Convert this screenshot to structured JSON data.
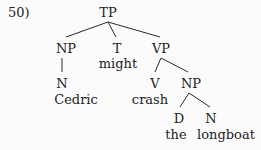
{
  "example_number": "50)",
  "tree": {
    "root": "TP",
    "nodes": [
      {
        "id": "tp",
        "label": "TP",
        "x": 108,
        "y": 6
      },
      {
        "id": "np_subj",
        "label": "NP",
        "x": 66,
        "y": 42
      },
      {
        "id": "t",
        "label": "T",
        "x": 117,
        "y": 42
      },
      {
        "id": "t_word",
        "label": "might",
        "x": 118,
        "y": 57
      },
      {
        "id": "vp",
        "label": "VP",
        "x": 161,
        "y": 42
      },
      {
        "id": "n_subj",
        "label": "N",
        "x": 62,
        "y": 77
      },
      {
        "id": "n_subj_word",
        "label": "Cedric",
        "x": 76,
        "y": 93
      },
      {
        "id": "v",
        "label": "V",
        "x": 155,
        "y": 77
      },
      {
        "id": "v_word",
        "label": "crash",
        "x": 150,
        "y": 93
      },
      {
        "id": "np_obj",
        "label": "NP",
        "x": 191,
        "y": 77
      },
      {
        "id": "d",
        "label": "D",
        "x": 179,
        "y": 112
      },
      {
        "id": "d_word",
        "label": "the",
        "x": 176,
        "y": 128
      },
      {
        "id": "n_obj",
        "label": "N",
        "x": 211,
        "y": 112
      },
      {
        "id": "n_obj_word",
        "label": "longboat",
        "x": 226,
        "y": 128
      }
    ],
    "edges": [
      {
        "from": "tp",
        "to": "np_subj",
        "x1": 108,
        "y1": 22,
        "x2": 66,
        "y2": 37
      },
      {
        "from": "tp",
        "to": "t",
        "x1": 108,
        "y1": 22,
        "x2": 116,
        "y2": 37
      },
      {
        "from": "tp",
        "to": "vp",
        "x1": 108,
        "y1": 22,
        "x2": 160,
        "y2": 37
      },
      {
        "from": "np_subj",
        "to": "n_subj",
        "x1": 62,
        "y1": 58,
        "x2": 62,
        "y2": 72
      },
      {
        "from": "vp",
        "to": "v",
        "x1": 161,
        "y1": 58,
        "x2": 155,
        "y2": 72
      },
      {
        "from": "vp",
        "to": "np_obj",
        "x1": 161,
        "y1": 58,
        "x2": 188,
        "y2": 72
      },
      {
        "from": "np_obj",
        "to": "d",
        "x1": 189,
        "y1": 93,
        "x2": 180,
        "y2": 107
      },
      {
        "from": "np_obj",
        "to": "n_obj",
        "x1": 189,
        "y1": 93,
        "x2": 210,
        "y2": 107
      }
    ]
  }
}
